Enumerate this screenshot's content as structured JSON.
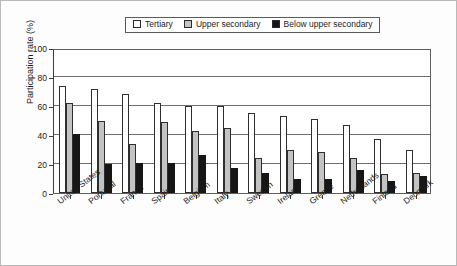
{
  "chart_data": {
    "type": "bar",
    "title": "",
    "subtitle": "",
    "xlabel": "",
    "ylabel": "Participation rate (%)",
    "ylim": [
      0,
      100
    ],
    "yticks": [
      0,
      20,
      40,
      60,
      80,
      100
    ],
    "ytick_labels": [
      "0",
      "20",
      "40",
      "60",
      "80",
      "100"
    ],
    "grid": "horizontal",
    "legend_position": "top-center",
    "categories": [
      "United States",
      "Portugal",
      "France",
      "Spain",
      "Belgium",
      "Italy",
      "Sweden",
      "Ireland",
      "Greece",
      "Netherlands",
      "Finland",
      "Denmark"
    ],
    "series": [
      {
        "name": "Tertiary",
        "color": "#ffffff",
        "values": [
          74,
          72,
          68,
          62,
          60,
          60,
          55,
          53,
          51,
          47,
          37,
          30
        ]
      },
      {
        "name": "Upper secondary",
        "color": "#c3c3c3",
        "values": [
          62,
          50,
          34,
          49,
          43,
          45,
          24,
          30,
          28,
          24,
          13,
          14
        ]
      },
      {
        "name": "Below upper secondary",
        "color": "#161616",
        "values": [
          41,
          20,
          21,
          21,
          26,
          17,
          14,
          10,
          10,
          16,
          8,
          12
        ]
      }
    ]
  },
  "legend": {
    "items": [
      {
        "label": "Tertiary",
        "swatch": "#ffffff"
      },
      {
        "label": "Upper secondary",
        "swatch": "#c3c3c3"
      },
      {
        "label": "Below upper secondary",
        "swatch": "#161616"
      }
    ]
  }
}
